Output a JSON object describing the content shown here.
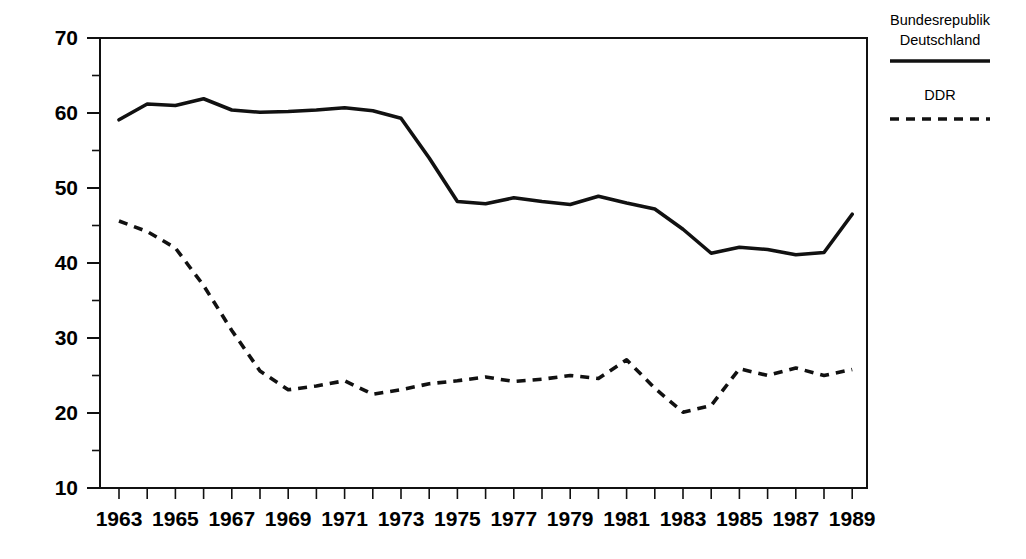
{
  "chart_data": {
    "type": "line",
    "title": "",
    "subtitle": "",
    "xlabel": "",
    "ylabel": "",
    "xlim": [
      1963,
      1989
    ],
    "ylim": [
      10,
      70
    ],
    "grid": false,
    "legend_position": "right",
    "y_ticks": [
      10,
      20,
      30,
      40,
      50,
      60,
      70
    ],
    "y_tick_labels": [
      "10",
      "20",
      "30",
      "40",
      "50",
      "60",
      "70"
    ],
    "y_minor_ticks": [
      15,
      25,
      35,
      45,
      55,
      65
    ],
    "x_ticks": [
      1963,
      1964,
      1965,
      1966,
      1967,
      1968,
      1969,
      1970,
      1971,
      1972,
      1973,
      1974,
      1975,
      1976,
      1977,
      1978,
      1979,
      1980,
      1981,
      1982,
      1983,
      1984,
      1985,
      1986,
      1987,
      1988,
      1989
    ],
    "x_tick_labels": [
      "1963",
      "",
      "1965",
      "",
      "1967",
      "",
      "1969",
      "",
      "1971",
      "",
      "1973",
      "",
      "1975",
      "",
      "1977",
      "",
      "1979",
      "",
      "1981",
      "",
      "1983",
      "",
      "1985",
      "",
      "1987",
      "",
      "1989"
    ],
    "x": [
      1963,
      1964,
      1965,
      1966,
      1967,
      1968,
      1969,
      1970,
      1971,
      1972,
      1973,
      1974,
      1975,
      1976,
      1977,
      1978,
      1979,
      1980,
      1981,
      1982,
      1983,
      1984,
      1985,
      1986,
      1987,
      1988,
      1989
    ],
    "series": [
      {
        "name": "Bundesrepublik Deutschland",
        "style": "solid",
        "color": "#111111",
        "values": [
          59.1,
          61.2,
          61.0,
          61.9,
          60.4,
          60.1,
          60.2,
          60.4,
          60.7,
          60.3,
          59.3,
          54.0,
          48.2,
          47.9,
          48.7,
          48.2,
          47.8,
          48.9,
          48.0,
          47.2,
          44.5,
          41.3,
          42.1,
          41.8,
          41.1,
          41.4,
          46.5
        ]
      },
      {
        "name": "DDR",
        "style": "dashed",
        "color": "#111111",
        "values": [
          45.6,
          44.2,
          42.0,
          37.0,
          31.0,
          25.6,
          23.1,
          23.6,
          24.3,
          22.5,
          23.1,
          23.9,
          24.3,
          24.8,
          24.2,
          24.5,
          25.0,
          24.6,
          27.1,
          23.3,
          20.1,
          21.0,
          25.9,
          25.0,
          26.0,
          25.0,
          25.8
        ]
      }
    ],
    "legend": [
      {
        "label_line1": "Bundesrepublik",
        "label_line2": "Deutschland",
        "style": "solid"
      },
      {
        "label_line1": "DDR",
        "label_line2": "",
        "style": "dashed"
      }
    ]
  }
}
